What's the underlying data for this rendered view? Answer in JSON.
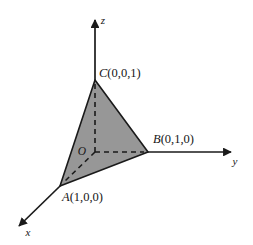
{
  "figure": {
    "background_color": "#ffffff",
    "stroke_color": "#1a1a1a",
    "fill_color": "#979797",
    "dash_color": "#1a1a1a",
    "width": 253,
    "height": 245
  },
  "axes": [
    {
      "id": "x",
      "label": "x",
      "label_x": 28,
      "label_y": 236,
      "from": [
        95,
        152
      ],
      "to": [
        19,
        226
      ],
      "arrow": true
    },
    {
      "id": "y",
      "label": "y",
      "label_x": 235,
      "label_y": 165,
      "from": [
        95,
        152
      ],
      "to": [
        231,
        152
      ],
      "arrow": true
    },
    {
      "id": "z",
      "label": "z",
      "label_x": 103,
      "label_y": 24,
      "from": [
        95,
        152
      ],
      "to": [
        95,
        20
      ],
      "arrow": true
    }
  ],
  "origin": {
    "label": "O",
    "label_x": 82,
    "label_y": 155,
    "point": [
      95,
      152
    ]
  },
  "points": [
    {
      "id": "A",
      "name": "A",
      "coords": "(1,0,0)",
      "label": "A(1,0,0)",
      "px": 60,
      "py": 186,
      "label_x": 62,
      "label_y": 201
    },
    {
      "id": "B",
      "name": "B",
      "coords": "(0,1,0)",
      "label": "B(0,1,0)",
      "px": 148,
      "py": 152,
      "label_x": 153,
      "label_y": 143
    },
    {
      "id": "C",
      "name": "C",
      "coords": "(0,0,1)",
      "label": "C(0,0,1)",
      "px": 95,
      "py": 80,
      "label_x": 99,
      "label_y": 77
    }
  ],
  "triangle": {
    "name": "triangle-ABC",
    "vertices": [
      [
        95,
        80
      ],
      [
        148,
        152
      ],
      [
        60,
        186
      ]
    ],
    "fill": "#979797",
    "stroke": "#1a1a1a"
  },
  "dashed_segments": [
    {
      "name": "o-to-c",
      "from": [
        95,
        152
      ],
      "to": [
        95,
        84
      ]
    },
    {
      "name": "o-to-b",
      "from": [
        95,
        152
      ],
      "to": [
        144,
        152
      ]
    },
    {
      "name": "o-to-a",
      "from": [
        95,
        152
      ],
      "to": [
        64,
        182
      ]
    }
  ]
}
